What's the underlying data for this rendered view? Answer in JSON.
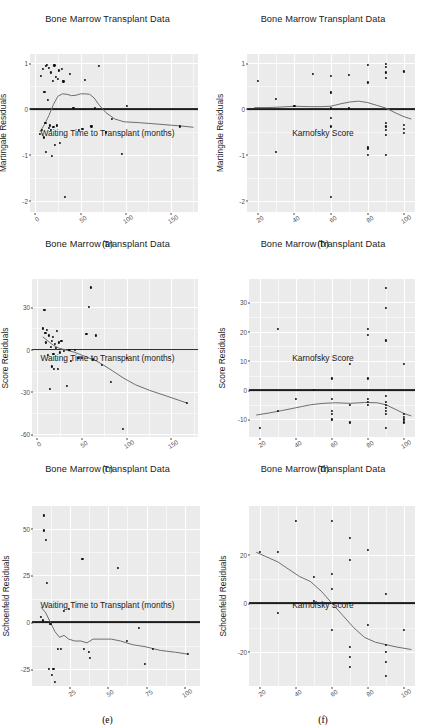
{
  "figure": {
    "title_common": "Bone Marrow Transplant Data",
    "background": "#ffffff",
    "panel_fill": "#ebebeb",
    "grid_color": "#ffffff",
    "point_color": "#101010",
    "refline_color": "#1c1c1c",
    "smooth_color": "#6e6e6e",
    "columns": 2,
    "rows": 3
  },
  "captions": {
    "a": "(a)",
    "b": "(b)",
    "c": "(c)",
    "d": "(d)",
    "e": "(e)",
    "f": "(f)"
  },
  "axis_titles": {
    "waiting_time": "Waiting Time to Transplant (months)",
    "karnofsky": "Karnofsky Score",
    "martingale": "Martingale Residuals",
    "score": "Score Residuals",
    "schoenfeld": "Schoenfeld Residuals"
  },
  "chart_data": [
    {
      "id": "a",
      "type": "scatter",
      "title": "Bone Marrow Transplant Data",
      "xlabel": "Waiting Time to Transplant (months)",
      "ylabel": "Martingale Residuals",
      "caption": "(a)",
      "xlim": [
        -6,
        180
      ],
      "ylim": [
        -2.25,
        1.2
      ],
      "xticks": [
        0,
        50,
        100,
        150
      ],
      "xticklabels": [
        "0",
        "50",
        "100",
        "150"
      ],
      "yticks": [
        1,
        0,
        -1,
        -2
      ],
      "yticklabels": [
        "1",
        "0",
        "-1",
        "-2"
      ],
      "grid": true,
      "hline": 0,
      "points": [
        [
          5,
          -0.55
        ],
        [
          6,
          0.72
        ],
        [
          7,
          -0.46
        ],
        [
          8,
          0.88
        ],
        [
          9,
          -0.62
        ],
        [
          10,
          0.38
        ],
        [
          11,
          -0.31
        ],
        [
          12,
          0.94
        ],
        [
          12,
          -0.93
        ],
        [
          13,
          0.96
        ],
        [
          14,
          0.2
        ],
        [
          15,
          -0.42
        ],
        [
          15,
          0.9
        ],
        [
          16,
          -0.36
        ],
        [
          17,
          -0.45
        ],
        [
          17,
          0.8
        ],
        [
          18,
          -1.02
        ],
        [
          19,
          0.62
        ],
        [
          20,
          -0.4
        ],
        [
          21,
          0.95
        ],
        [
          22,
          -0.78
        ],
        [
          23,
          0.7
        ],
        [
          24,
          -0.36
        ],
        [
          25,
          0.66
        ],
        [
          26,
          0.84
        ],
        [
          27,
          -0.74
        ],
        [
          29,
          0.88
        ],
        [
          31,
          0.6
        ],
        [
          33,
          -1.92
        ],
        [
          38,
          0.76
        ],
        [
          42,
          0.02
        ],
        [
          48,
          -0.45
        ],
        [
          52,
          -0.44
        ],
        [
          55,
          0.64
        ],
        [
          62,
          -0.38
        ],
        [
          66,
          0.02
        ],
        [
          70,
          0.94
        ],
        [
          78,
          -0.51
        ],
        [
          85,
          -0.22
        ],
        [
          96,
          -0.98
        ],
        [
          101,
          0.06
        ],
        [
          160,
          -0.38
        ]
      ],
      "smooth": [
        [
          5,
          -0.5
        ],
        [
          10,
          -0.34
        ],
        [
          15,
          -0.14
        ],
        [
          20,
          0.1
        ],
        [
          25,
          0.28
        ],
        [
          30,
          0.33
        ],
        [
          35,
          0.32
        ],
        [
          40,
          0.29
        ],
        [
          45,
          0.3
        ],
        [
          50,
          0.33
        ],
        [
          55,
          0.33
        ],
        [
          60,
          0.32
        ],
        [
          65,
          0.24
        ],
        [
          70,
          0.1
        ],
        [
          78,
          -0.08
        ],
        [
          88,
          -0.22
        ],
        [
          98,
          -0.28
        ],
        [
          115,
          -0.3
        ],
        [
          135,
          -0.33
        ],
        [
          160,
          -0.37
        ],
        [
          175,
          -0.4
        ]
      ]
    },
    {
      "id": "b",
      "type": "scatter",
      "title": "Bone Marrow Transplant Data",
      "xlabel": "Karnofsky Score",
      "ylabel": "Martingale Residuals",
      "caption": "(b)",
      "xlim": [
        14,
        106
      ],
      "ylim": [
        -2.25,
        1.2
      ],
      "xticks": [
        20,
        40,
        60,
        80,
        100
      ],
      "xticklabels": [
        "20",
        "40",
        "60",
        "80",
        "100"
      ],
      "yticks": [
        1,
        0,
        -1,
        -2
      ],
      "yticklabels": [
        "1",
        "0",
        "-1",
        "-2"
      ],
      "grid": true,
      "hline": 0,
      "points": [
        [
          20,
          0.62
        ],
        [
          30,
          0.22
        ],
        [
          30,
          -0.93
        ],
        [
          40,
          0.06
        ],
        [
          50,
          0.76
        ],
        [
          60,
          0.72
        ],
        [
          60,
          0.36
        ],
        [
          60,
          0.03
        ],
        [
          60,
          -0.2
        ],
        [
          60,
          -0.38
        ],
        [
          60,
          -1.92
        ],
        [
          70,
          0.74
        ],
        [
          70,
          0.02
        ],
        [
          80,
          0.96
        ],
        [
          80,
          0.58
        ],
        [
          80,
          -0.84
        ],
        [
          80,
          -0.88
        ],
        [
          80,
          -1.0
        ],
        [
          90,
          0.98
        ],
        [
          90,
          0.92
        ],
        [
          90,
          0.8
        ],
        [
          90,
          0.68
        ],
        [
          90,
          -0.3
        ],
        [
          90,
          -0.38
        ],
        [
          90,
          -0.46
        ],
        [
          90,
          -0.56
        ],
        [
          90,
          -1.0
        ],
        [
          100,
          0.82
        ],
        [
          100,
          -0.34
        ],
        [
          100,
          -0.44
        ],
        [
          100,
          -0.52
        ]
      ],
      "smooth": [
        [
          18,
          0.03
        ],
        [
          25,
          0.03
        ],
        [
          32,
          0.04
        ],
        [
          40,
          0.06
        ],
        [
          48,
          0.05
        ],
        [
          55,
          0.05
        ],
        [
          60,
          0.06
        ],
        [
          65,
          0.11
        ],
        [
          70,
          0.15
        ],
        [
          75,
          0.17
        ],
        [
          80,
          0.14
        ],
        [
          85,
          0.08
        ],
        [
          90,
          0.02
        ],
        [
          95,
          -0.08
        ],
        [
          100,
          -0.17
        ],
        [
          104,
          -0.22
        ]
      ]
    },
    {
      "id": "c",
      "type": "scatter",
      "title": "Bone Marrow Transplant Data",
      "xlabel": "Waiting Time to Transplant (months)",
      "ylabel": "Score Residuals",
      "caption": "(c)",
      "xlim": [
        -6,
        180
      ],
      "ylim": [
        -62,
        50
      ],
      "xticks": [
        0,
        50,
        100,
        150
      ],
      "xticklabels": [
        "0",
        "50",
        "100",
        "150"
      ],
      "yticks": [
        30,
        0,
        -30,
        -60
      ],
      "yticklabels": [
        "30",
        "0",
        "-30",
        "-60"
      ],
      "grid": true,
      "hline": 0,
      "points": [
        [
          6,
          15
        ],
        [
          8,
          28
        ],
        [
          9,
          12
        ],
        [
          10,
          5
        ],
        [
          11,
          14
        ],
        [
          12,
          -4
        ],
        [
          13,
          10
        ],
        [
          14,
          -28
        ],
        [
          15,
          2
        ],
        [
          16,
          6
        ],
        [
          16,
          -12
        ],
        [
          17,
          9
        ],
        [
          18,
          -3
        ],
        [
          19,
          -14
        ],
        [
          20,
          4
        ],
        [
          21,
          1
        ],
        [
          22,
          13
        ],
        [
          23,
          -14
        ],
        [
          24,
          5
        ],
        [
          25,
          -2
        ],
        [
          27,
          6
        ],
        [
          30,
          -1
        ],
        [
          33,
          -26
        ],
        [
          36,
          0
        ],
        [
          38,
          -8
        ],
        [
          42,
          0
        ],
        [
          46,
          -6
        ],
        [
          50,
          -6
        ],
        [
          55,
          11
        ],
        [
          58,
          30
        ],
        [
          60,
          44
        ],
        [
          62,
          -7
        ],
        [
          66,
          10
        ],
        [
          72,
          -11
        ],
        [
          82,
          -23
        ],
        [
          96,
          -56
        ],
        [
          100,
          -6
        ],
        [
          168,
          -38
        ]
      ],
      "smooth": [
        [
          6,
          9
        ],
        [
          12,
          6
        ],
        [
          18,
          3
        ],
        [
          24,
          1
        ],
        [
          30,
          0
        ],
        [
          36,
          -1
        ],
        [
          42,
          -2
        ],
        [
          50,
          -4
        ],
        [
          58,
          -6
        ],
        [
          66,
          -8
        ],
        [
          74,
          -11
        ],
        [
          84,
          -15
        ],
        [
          96,
          -20
        ],
        [
          110,
          -25
        ],
        [
          126,
          -29
        ],
        [
          145,
          -33
        ],
        [
          168,
          -38
        ]
      ]
    },
    {
      "id": "d",
      "type": "scatter",
      "title": "Bone Marrow Transplant Data",
      "xlabel": "Karnofsky Score",
      "ylabel": "Score Residuals",
      "caption": "(d)",
      "xlim": [
        14,
        106
      ],
      "ylim": [
        -16,
        38
      ],
      "xticks": [
        20,
        40,
        60,
        80,
        100
      ],
      "xticklabels": [
        "20",
        "40",
        "60",
        "80",
        "100"
      ],
      "yticks": [
        30,
        20,
        10,
        0,
        -10
      ],
      "yticklabels": [
        "30",
        "20",
        "10",
        "0",
        "-10"
      ],
      "grid": true,
      "hline": 0,
      "points": [
        [
          20,
          -13
        ],
        [
          30,
          21
        ],
        [
          30,
          -7
        ],
        [
          40,
          -3
        ],
        [
          50,
          0
        ],
        [
          60,
          4
        ],
        [
          60,
          -3
        ],
        [
          60,
          -7
        ],
        [
          60,
          -8
        ],
        [
          60,
          -10
        ],
        [
          70,
          9
        ],
        [
          70,
          -5
        ],
        [
          70,
          -11
        ],
        [
          80,
          21
        ],
        [
          80,
          19
        ],
        [
          80,
          4
        ],
        [
          80,
          -3
        ],
        [
          80,
          -4
        ],
        [
          80,
          -5
        ],
        [
          90,
          35
        ],
        [
          90,
          28
        ],
        [
          90,
          17
        ],
        [
          90,
          -2
        ],
        [
          90,
          -4
        ],
        [
          90,
          -5
        ],
        [
          90,
          -6
        ],
        [
          90,
          -7
        ],
        [
          90,
          -8
        ],
        [
          90,
          -13
        ],
        [
          100,
          9
        ],
        [
          100,
          -8
        ],
        [
          100,
          -9
        ],
        [
          100,
          -10
        ],
        [
          100,
          -11
        ]
      ],
      "smooth": [
        [
          18,
          -8.5
        ],
        [
          25,
          -7.8
        ],
        [
          32,
          -7.0
        ],
        [
          40,
          -6.0
        ],
        [
          48,
          -5.0
        ],
        [
          55,
          -4.5
        ],
        [
          62,
          -4.3
        ],
        [
          70,
          -4.5
        ],
        [
          78,
          -4.2
        ],
        [
          85,
          -4.3
        ],
        [
          90,
          -5.0
        ],
        [
          95,
          -6.5
        ],
        [
          100,
          -8.0
        ],
        [
          104,
          -8.8
        ]
      ]
    },
    {
      "id": "e",
      "type": "scatter",
      "title": "Bone Marrow Transplant Data",
      "xlabel": "Waiting Time to Transplant (months)",
      "ylabel": "Schoenfeld Residuals",
      "caption": "(e)",
      "xlim": [
        0,
        110
      ],
      "ylim": [
        -34,
        62
      ],
      "xticks": [
        25,
        50,
        75,
        100
      ],
      "xticklabels": [
        "25",
        "50",
        "75",
        "100"
      ],
      "yticks": [
        50,
        25,
        0,
        -25
      ],
      "yticklabels": [
        "50",
        "25",
        "0",
        "-25"
      ],
      "grid": true,
      "hline": 0,
      "points": [
        [
          6,
          3
        ],
        [
          7,
          1
        ],
        [
          8,
          57
        ],
        [
          8,
          49
        ],
        [
          9,
          44
        ],
        [
          10,
          21
        ],
        [
          11,
          -25
        ],
        [
          12,
          -1
        ],
        [
          13,
          -28
        ],
        [
          14,
          -25
        ],
        [
          15,
          -32
        ],
        [
          17,
          -14
        ],
        [
          19,
          -14
        ],
        [
          21,
          6
        ],
        [
          24,
          7
        ],
        [
          33,
          34
        ],
        [
          34,
          -14
        ],
        [
          37,
          -16
        ],
        [
          38,
          -19
        ],
        [
          56,
          29
        ],
        [
          62,
          -10
        ],
        [
          70,
          -3
        ],
        [
          74,
          -22
        ],
        [
          79,
          -14
        ],
        [
          102,
          -17
        ]
      ],
      "smooth": [
        [
          6,
          8
        ],
        [
          9,
          5
        ],
        [
          12,
          0
        ],
        [
          15,
          -5
        ],
        [
          18,
          -8
        ],
        [
          21,
          -7
        ],
        [
          24,
          -9
        ],
        [
          28,
          -10
        ],
        [
          32,
          -10
        ],
        [
          36,
          -11
        ],
        [
          40,
          -9
        ],
        [
          46,
          -9
        ],
        [
          52,
          -9
        ],
        [
          58,
          -10
        ],
        [
          66,
          -12
        ],
        [
          74,
          -13
        ],
        [
          84,
          -15
        ],
        [
          94,
          -16
        ],
        [
          102,
          -17
        ]
      ]
    },
    {
      "id": "f",
      "type": "scatter",
      "title": "Bone Marrow Transplant Data",
      "xlabel": "Karnofsky Score",
      "ylabel": "Schoenfeld Residuals",
      "caption": "(f)",
      "xlim": [
        14,
        106
      ],
      "ylim": [
        -34,
        40
      ],
      "xticks": [
        20,
        40,
        60,
        80,
        100
      ],
      "xticklabels": [
        "20",
        "40",
        "60",
        "80",
        "100"
      ],
      "yticks": [
        20,
        0,
        -20
      ],
      "yticklabels": [
        "20",
        "0",
        "-20"
      ],
      "grid": true,
      "hline": 0,
      "points": [
        [
          20,
          21
        ],
        [
          30,
          21
        ],
        [
          30,
          -4
        ],
        [
          40,
          34
        ],
        [
          50,
          11
        ],
        [
          50,
          1
        ],
        [
          60,
          34
        ],
        [
          60,
          12
        ],
        [
          60,
          6
        ],
        [
          60,
          -11
        ],
        [
          70,
          27
        ],
        [
          70,
          18
        ],
        [
          70,
          0
        ],
        [
          70,
          -18
        ],
        [
          70,
          -22
        ],
        [
          70,
          -26
        ],
        [
          80,
          22
        ],
        [
          80,
          -9
        ],
        [
          90,
          4
        ],
        [
          90,
          -17
        ],
        [
          90,
          -20
        ],
        [
          90,
          -24
        ],
        [
          90,
          -30
        ],
        [
          100,
          -11
        ]
      ],
      "smooth": [
        [
          18,
          21
        ],
        [
          24,
          19
        ],
        [
          30,
          17
        ],
        [
          36,
          14
        ],
        [
          42,
          11
        ],
        [
          48,
          9
        ],
        [
          54,
          5
        ],
        [
          60,
          0
        ],
        [
          66,
          -5
        ],
        [
          72,
          -10
        ],
        [
          78,
          -14
        ],
        [
          84,
          -16
        ],
        [
          90,
          -17
        ],
        [
          96,
          -18
        ],
        [
          104,
          -19
        ]
      ]
    }
  ]
}
